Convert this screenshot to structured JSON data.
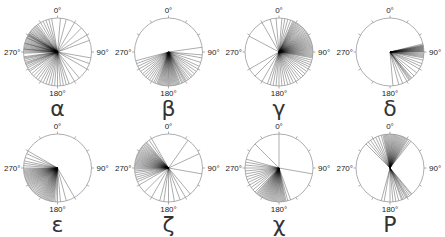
{
  "axis_labels": {
    "top": "0°",
    "right": "90°",
    "bottom": "180°",
    "left": "270°"
  },
  "colors": {
    "circle": "#999999",
    "line": "#000000",
    "text": "#222222"
  },
  "chart_data": [
    {
      "type": "circular",
      "label": "α",
      "cx": 57.5,
      "cy": 52,
      "r": 34,
      "angles": [
        290,
        292,
        294,
        295,
        296,
        298,
        299,
        300,
        301,
        302,
        303,
        305,
        306,
        308,
        310,
        312,
        314,
        316,
        318,
        320,
        322,
        325,
        330,
        335,
        340,
        268,
        270,
        272,
        274,
        275,
        276,
        278,
        280,
        282,
        284,
        285,
        286,
        288,
        262,
        260,
        258,
        255,
        252,
        250,
        248,
        245,
        242,
        238,
        235,
        230,
        225,
        220,
        215,
        210,
        205,
        200,
        195,
        190,
        185,
        180,
        175,
        170,
        165,
        160,
        150,
        140,
        120,
        110,
        100,
        70,
        60,
        45,
        30,
        15,
        5,
        350,
        345
      ]
    },
    {
      "type": "circular",
      "label": "β",
      "cx": 168.5,
      "cy": 52,
      "r": 34,
      "angles": [
        82,
        95,
        100,
        108,
        115,
        120,
        125,
        130,
        135,
        138,
        142,
        145,
        148,
        150,
        152,
        155,
        157,
        160,
        162,
        164,
        166,
        168,
        170,
        172,
        174,
        176,
        178,
        180,
        182,
        184,
        186,
        188,
        190,
        192,
        194,
        196,
        198,
        200,
        203,
        206,
        210,
        214,
        218,
        222,
        226,
        230,
        235,
        240,
        245,
        250,
        255
      ]
    },
    {
      "type": "circular",
      "label": "γ",
      "cx": 279,
      "cy": 52,
      "r": 34,
      "angles": [
        20,
        24,
        26,
        28,
        30,
        32,
        34,
        36,
        38,
        40,
        42,
        44,
        46,
        48,
        50,
        52,
        54,
        56,
        58,
        60,
        62,
        64,
        66,
        68,
        70,
        72,
        74,
        76,
        78,
        80,
        82,
        84,
        86,
        88,
        90,
        92,
        94,
        96,
        98,
        100,
        104,
        108,
        112,
        116,
        120,
        125,
        130,
        135,
        140,
        145,
        150,
        155,
        160,
        165,
        170,
        175,
        180,
        185,
        190,
        195,
        200,
        210,
        225,
        240,
        298,
        330,
        345,
        355,
        5,
        10,
        15
      ]
    },
    {
      "type": "circular",
      "label": "δ",
      "cx": 390,
      "cy": 52,
      "r": 34,
      "angles": [
        76,
        78,
        79,
        80,
        81,
        82,
        83,
        84,
        85,
        86,
        87,
        88,
        89,
        90,
        92,
        94,
        96,
        98,
        100,
        104,
        110,
        115,
        120,
        128,
        135,
        140,
        142,
        144,
        146,
        150,
        158,
        165,
        175
      ]
    },
    {
      "type": "circular",
      "label": "ε",
      "cx": 57.5,
      "cy": 168,
      "r": 34,
      "angles": [
        150,
        165,
        175,
        180,
        183,
        186,
        188,
        190,
        192,
        194,
        196,
        198,
        200,
        202,
        204,
        206,
        208,
        210,
        212,
        214,
        216,
        218,
        220,
        222,
        224,
        226,
        228,
        230,
        232,
        234,
        236,
        238,
        240,
        242,
        244,
        246,
        248,
        250,
        252,
        254,
        256,
        258,
        260,
        262,
        264,
        266,
        268,
        270,
        274,
        278,
        282,
        288,
        295,
        300
      ]
    },
    {
      "type": "circular",
      "label": "ζ",
      "cx": 168.5,
      "cy": 168,
      "r": 34,
      "angles": [
        65,
        100,
        140,
        150,
        160,
        170,
        180,
        188,
        195,
        210,
        225,
        240,
        246,
        250,
        254,
        258,
        262,
        265,
        268,
        270,
        272,
        274,
        276,
        278,
        280,
        282,
        284,
        286,
        288,
        290,
        292,
        294,
        296,
        298,
        300,
        302,
        304,
        306,
        308,
        310,
        312,
        314,
        316,
        318,
        320,
        325,
        330,
        35
      ]
    },
    {
      "type": "circular",
      "label": "χ",
      "cx": 279,
      "cy": 168,
      "r": 34,
      "angles": [
        0,
        100,
        160,
        165,
        168,
        170,
        172,
        174,
        176,
        178,
        180,
        182,
        184,
        186,
        188,
        190,
        192,
        194,
        196,
        198,
        200,
        202,
        204,
        206,
        208,
        210,
        212,
        214,
        216,
        218,
        220,
        222,
        225,
        230,
        235,
        240,
        245,
        250,
        255,
        260,
        265,
        270,
        275,
        280,
        285,
        315
      ]
    },
    {
      "type": "circular",
      "label": "Ρ",
      "cx": 390,
      "cy": 168,
      "r": 34,
      "angles": [
        340,
        345,
        348,
        350,
        352,
        354,
        356,
        358,
        0,
        2,
        4,
        6,
        8,
        10,
        12,
        14,
        16,
        18,
        20,
        22,
        24,
        26,
        28,
        30,
        32,
        35,
        38,
        320,
        325,
        330,
        335,
        140,
        142,
        145,
        148,
        150,
        152,
        155,
        158,
        160,
        165,
        170,
        175,
        180,
        190,
        195,
        315
      ]
    }
  ]
}
